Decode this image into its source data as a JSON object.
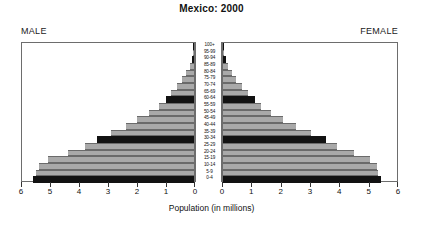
{
  "chart_data": {
    "type": "bar",
    "subtype": "population-pyramid",
    "title": "Mexico: 2000",
    "xlabel": "Population (in millions)",
    "ylabel": "",
    "grid": false,
    "legend_position": "none",
    "left_panel_label": "MALE",
    "right_panel_label": "FEMALE",
    "left_axis_ticks": [
      6,
      5,
      4,
      3,
      2,
      1,
      0
    ],
    "right_axis_ticks": [
      0,
      1,
      2,
      3,
      4,
      5,
      6
    ],
    "xlim": [
      0,
      6
    ],
    "categories": [
      "0-4",
      "5-9",
      "10-14",
      "15-19",
      "20-24",
      "25-29",
      "30-34",
      "35-39",
      "40-44",
      "45-49",
      "50-54",
      "55-59",
      "60-64",
      "65-69",
      "70-74",
      "75-79",
      "80-84",
      "85-89",
      "90-94",
      "95-99",
      "100+"
    ],
    "series": [
      {
        "name": "MALE",
        "side": "left",
        "values": [
          5.55,
          5.45,
          5.35,
          5.05,
          4.35,
          3.75,
          3.35,
          2.85,
          2.35,
          1.95,
          1.55,
          1.2,
          0.98,
          0.78,
          0.58,
          0.4,
          0.26,
          0.15,
          0.08,
          0.04,
          0.02
        ]
      },
      {
        "name": "FEMALE",
        "side": "right",
        "values": [
          5.4,
          5.3,
          5.25,
          5.0,
          4.45,
          3.9,
          3.5,
          3.0,
          2.5,
          2.05,
          1.65,
          1.3,
          1.08,
          0.86,
          0.66,
          0.46,
          0.31,
          0.18,
          0.1,
          0.05,
          0.02
        ]
      }
    ],
    "bar_shading": [
      "dark",
      "light",
      "light",
      "light",
      "light",
      "light",
      "dark",
      "light",
      "light",
      "light",
      "light",
      "light",
      "dark",
      "light",
      "light",
      "light",
      "light",
      "light",
      "dark",
      "light",
      "dark"
    ],
    "colors": {
      "dark": "#121212",
      "light": "#a9a9a9",
      "frame": "#6d6d6d",
      "background": "#ffffff"
    }
  }
}
